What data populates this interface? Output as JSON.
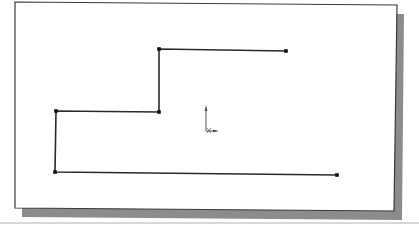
{
  "viewport": {
    "background": "#ffffff",
    "frame_fill": "#ffffff",
    "frame_stroke": "#3a3a3a",
    "shadow_color": "#8c8c8c"
  },
  "sketch": {
    "line_color": "#2a2a2a",
    "vertex_color": "#111111",
    "polyline_points": [
      [
        337,
        175
      ],
      [
        55,
        172
      ],
      [
        56,
        111
      ],
      [
        159,
        112
      ],
      [
        159,
        49
      ],
      [
        286,
        51
      ]
    ],
    "vertices": [
      [
        337,
        175
      ],
      [
        55,
        172
      ],
      [
        56,
        111
      ],
      [
        159,
        112
      ],
      [
        159,
        49
      ],
      [
        286,
        51
      ]
    ]
  },
  "origin": {
    "x": 206,
    "y": 131,
    "color": "#555555",
    "label": "origin-symbol"
  }
}
